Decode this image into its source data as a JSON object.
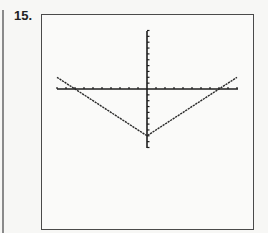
{
  "problem": {
    "label": "15."
  },
  "colors": {
    "axis": "#1e1e1e",
    "curve": "#2a2a2a",
    "frame": "#4a4a4a",
    "background": "#fafaf9"
  },
  "chart_data": {
    "type": "line",
    "title": "",
    "xlabel": "",
    "ylabel": "",
    "function": "y = |x| - 8",
    "xlim": [
      -10,
      10
    ],
    "ylim": [
      -10,
      10
    ],
    "xscale": 1,
    "yscale": 1,
    "grid": false,
    "legend": null,
    "series": [
      {
        "name": "y = |x| - 8",
        "x": [
          -10,
          -8,
          0,
          8,
          10
        ],
        "y": [
          2,
          0,
          -8,
          0,
          2
        ]
      }
    ]
  }
}
